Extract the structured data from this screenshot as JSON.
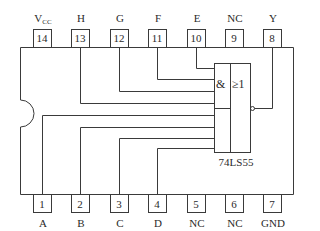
{
  "chip": {
    "part_number": "74LS55",
    "gate_symbols": {
      "and": "&",
      "or": "≥1"
    }
  },
  "top_pins": [
    {
      "number": "14",
      "label": "V",
      "label_sub": "CC"
    },
    {
      "number": "13",
      "label": "H"
    },
    {
      "number": "12",
      "label": "G"
    },
    {
      "number": "11",
      "label": "F"
    },
    {
      "number": "10",
      "label": "E"
    },
    {
      "number": "9",
      "label": "NC"
    },
    {
      "number": "8",
      "label": "Y"
    }
  ],
  "bottom_pins": [
    {
      "number": "1",
      "label": "A"
    },
    {
      "number": "2",
      "label": "B"
    },
    {
      "number": "3",
      "label": "C"
    },
    {
      "number": "4",
      "label": "D"
    },
    {
      "number": "5",
      "label": "NC"
    },
    {
      "number": "6",
      "label": "NC"
    },
    {
      "number": "7",
      "label": "GND"
    }
  ],
  "colors": {
    "line": "#3a3a3a",
    "text": "#2a2a2a",
    "background": "#ffffff"
  }
}
